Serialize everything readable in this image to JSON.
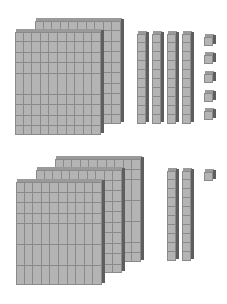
{
  "diagram": {
    "colors": {
      "face": "#b4b4b4",
      "grid": "#8a8a8a",
      "top": "#9a9a9a",
      "side": "#5e5e5e"
    },
    "groups": [
      {
        "name": "top-group",
        "hundreds": 2,
        "tens": 4,
        "ones": 5,
        "value": 245
      },
      {
        "name": "bottom-group",
        "hundreds": 3,
        "tens": 2,
        "ones": 1,
        "value": 321
      }
    ]
  }
}
